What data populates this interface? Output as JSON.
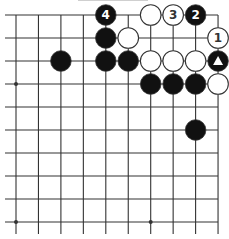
{
  "diagram": {
    "type": "go-board-fragment",
    "columns": 10,
    "rows": 10,
    "edges": {
      "top": true,
      "right": true,
      "left": false,
      "bottom": false
    },
    "star_points": [
      [
        0,
        3
      ],
      [
        0,
        9
      ],
      [
        6,
        9
      ]
    ],
    "stones": [
      {
        "col": 4,
        "row": 0,
        "color": "black",
        "label": "4"
      },
      {
        "col": 6,
        "row": 0,
        "color": "white",
        "label": ""
      },
      {
        "col": 7,
        "row": 0,
        "color": "white",
        "label": "3"
      },
      {
        "col": 8,
        "row": 0,
        "color": "black",
        "label": "2"
      },
      {
        "col": 4,
        "row": 1,
        "color": "black",
        "label": ""
      },
      {
        "col": 5,
        "row": 1,
        "color": "white",
        "label": ""
      },
      {
        "col": 9,
        "row": 1,
        "color": "white",
        "label": "1"
      },
      {
        "col": 2,
        "row": 2,
        "color": "black",
        "label": ""
      },
      {
        "col": 4,
        "row": 2,
        "color": "black",
        "label": ""
      },
      {
        "col": 5,
        "row": 2,
        "color": "black",
        "label": ""
      },
      {
        "col": 6,
        "row": 2,
        "color": "white",
        "label": ""
      },
      {
        "col": 7,
        "row": 2,
        "color": "white",
        "label": ""
      },
      {
        "col": 8,
        "row": 2,
        "color": "white",
        "label": ""
      },
      {
        "col": 9,
        "row": 2,
        "color": "black",
        "label": "",
        "marker": "triangle"
      },
      {
        "col": 6,
        "row": 3,
        "color": "black",
        "label": ""
      },
      {
        "col": 7,
        "row": 3,
        "color": "black",
        "label": ""
      },
      {
        "col": 8,
        "row": 3,
        "color": "black",
        "label": ""
      },
      {
        "col": 9,
        "row": 3,
        "color": "white",
        "label": ""
      },
      {
        "col": 8,
        "row": 5,
        "color": "black",
        "label": ""
      }
    ],
    "colors": {
      "line": "#333333",
      "black_stone": "#111111",
      "white_stone": "#ffffff",
      "black_label": "#ffffff",
      "white_label": "#333333"
    }
  }
}
